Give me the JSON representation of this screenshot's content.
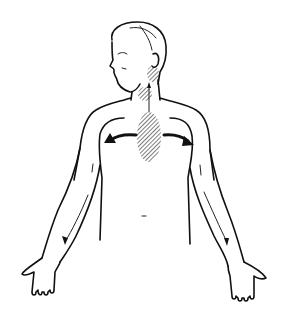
{
  "figure": {
    "description": "Line illustration of a man's upper body with arms outstretched; hatched areas on neck and chest with arrows radiating toward both arms",
    "regions": [
      {
        "name": "jaw-neck",
        "shading": "hatched"
      },
      {
        "name": "throat",
        "shading": "hatched"
      },
      {
        "name": "chest",
        "shading": "hatched"
      }
    ],
    "arrows": [
      {
        "from": "chest",
        "to": "neck",
        "direction": "up"
      },
      {
        "from": "chest",
        "to": "left-shoulder",
        "direction": "left"
      },
      {
        "from": "chest",
        "to": "right-shoulder",
        "direction": "right"
      },
      {
        "from": "left-shoulder",
        "to": "left-hand",
        "direction": "down"
      },
      {
        "from": "right-shoulder",
        "to": "right-hand",
        "direction": "down"
      }
    ],
    "colors": {
      "line": "#111111",
      "background": "#ffffff"
    }
  }
}
